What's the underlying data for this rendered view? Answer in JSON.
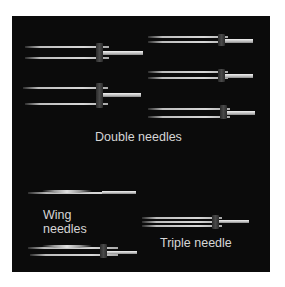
{
  "figure": {
    "background": "#0b0b0b",
    "labels": {
      "double": "Double needles",
      "wing_line1": "Wing",
      "wing_line2": "needles",
      "triple": "Triple needle"
    },
    "groups": [
      {
        "name": "Double needles",
        "count": 5
      },
      {
        "name": "Wing needles",
        "count": 2
      },
      {
        "name": "Triple needle",
        "count": 1
      }
    ]
  }
}
